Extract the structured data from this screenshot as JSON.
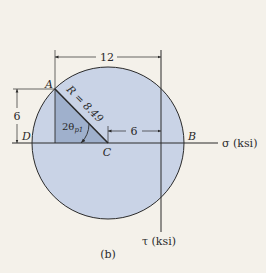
{
  "figure": {
    "caption": "(b)",
    "colors": {
      "background": "#f4f1ea",
      "circle_fill": "#c9d3e6",
      "triangle_fill": "#9fb0cc",
      "line": "#2a2a2a"
    },
    "axes": {
      "sigma_label": "σ (ksi)",
      "tau_label": "τ (ksi)"
    },
    "points": {
      "A": "A",
      "B": "B",
      "C": "C",
      "D": "D"
    },
    "labels": {
      "radius": "R = 8.49",
      "angle": "2θ",
      "angle_sub": "p1"
    },
    "dimensions": {
      "top": "12",
      "left": "6",
      "center_to_axis": "6"
    }
  }
}
